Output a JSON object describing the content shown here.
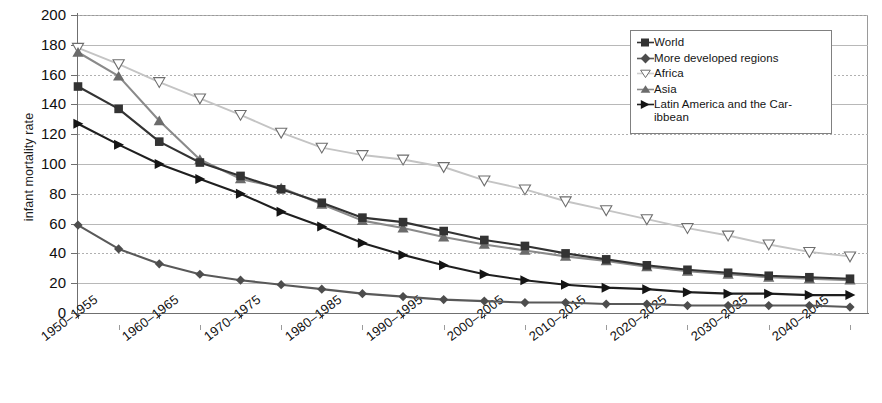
{
  "chart_data": {
    "type": "line",
    "title": "",
    "xlabel": "",
    "ylabel": "infant mortality rate",
    "ylim": [
      0,
      200
    ],
    "ytick_step": 20,
    "grid": true,
    "legend_position": "top-right",
    "yticks": [
      "200",
      "180",
      "160",
      "140",
      "120",
      "100",
      "80",
      "60",
      "40",
      "20",
      "0"
    ],
    "categories": [
      "1950–1955",
      "1955–1960",
      "1960–1965",
      "1965–1970",
      "1970–1975",
      "1975–1980",
      "1980–1985",
      "1985–1990",
      "1990–1995",
      "1995–2000",
      "2000–2005",
      "2005–2010",
      "2010–2015",
      "2015–2020",
      "2020–2025",
      "2025–2030",
      "2030–2035",
      "2035–2040",
      "2040–2045",
      "2045–2050"
    ],
    "xtick_labels": [
      "1950–1955",
      "1960–1965",
      "1970–1975",
      "1980–1985",
      "1990–1995",
      "2000–2005",
      "2010–2015",
      "2020–2025",
      "2030–2035",
      "2040–2045"
    ],
    "series": [
      {
        "name": "World",
        "marker": "square",
        "color": "#333333",
        "values": [
          152,
          137,
          115,
          101,
          92,
          83,
          74,
          64,
          61,
          55,
          49,
          45,
          40,
          36,
          32,
          29,
          27,
          25,
          24,
          23
        ]
      },
      {
        "name": "More developed regions",
        "marker": "diamond",
        "color": "#595959",
        "values": [
          59,
          43,
          33,
          26,
          22,
          19,
          16,
          13,
          11,
          9,
          8,
          7,
          7,
          6,
          6,
          5,
          5,
          5,
          5,
          4
        ]
      },
      {
        "name": "Africa",
        "marker": "triangle-down",
        "color": "#c4c4c4",
        "values": [
          178,
          167,
          155,
          144,
          133,
          121,
          111,
          106,
          103,
          98,
          89,
          83,
          75,
          69,
          63,
          57,
          52,
          46,
          41,
          38
        ]
      },
      {
        "name": "Asia",
        "marker": "triangle-up",
        "color": "#8a8a8a",
        "values": [
          175,
          159,
          129,
          103,
          90,
          84,
          73,
          62,
          57,
          51,
          46,
          42,
          38,
          35,
          31,
          28,
          26,
          24,
          23,
          22
        ]
      },
      {
        "name": "Latin America and the Caribbean",
        "marker": "triangle-right",
        "color": "#1f1f1f",
        "values": [
          127,
          113,
          100,
          90,
          80,
          68,
          58,
          47,
          39,
          32,
          26,
          22,
          19,
          17,
          16,
          14,
          13,
          13,
          12,
          12
        ]
      }
    ]
  },
  "legend": {
    "items": [
      {
        "label": "World"
      },
      {
        "label": "More developed regions"
      },
      {
        "label": "Africa"
      },
      {
        "label": "Asia"
      },
      {
        "label": "Latin America and the Car-",
        "label2": "ibbean"
      }
    ]
  }
}
